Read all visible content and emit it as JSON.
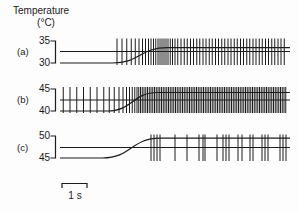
{
  "title": {
    "line1": "Temperature",
    "line2": "(°C)"
  },
  "scale_bar": {
    "label": "1 s",
    "seconds": 1
  },
  "chart_data": {
    "type": "line",
    "title": "Temperature (°C)",
    "layout_hint": "three stacked traces, each with spike train over a temperature ramp; time scale bar 1 s",
    "panels": [
      {
        "label": "(a)",
        "y_ticks": [
          35,
          30
        ],
        "baseline_temp_c": 30,
        "plateau_temp_c": 33.5,
        "ramp_start_s": 2.1,
        "ramp_end_s": 4.3,
        "duration_s": 9.2,
        "spike_times_s": [
          2.28,
          2.48,
          2.67,
          2.85,
          3.01,
          3.16,
          3.3,
          3.42,
          3.54,
          3.64,
          3.74,
          3.83,
          3.92,
          4.0,
          4.08,
          4.16,
          4.24,
          4.32,
          4.41,
          4.5,
          4.6,
          4.71,
          4.84,
          4.97,
          5.09,
          5.22,
          5.34,
          5.47,
          5.59,
          5.72,
          5.84,
          5.97,
          6.09,
          6.22,
          6.34,
          6.47,
          6.59,
          6.72,
          6.84,
          6.97,
          7.09,
          7.22,
          7.34,
          7.47,
          7.59,
          7.72,
          7.84,
          7.97,
          8.09,
          8.22,
          8.34,
          8.47,
          8.59,
          8.72,
          8.84,
          8.97
        ]
      },
      {
        "label": "(b)",
        "y_ticks": [
          45,
          40
        ],
        "baseline_temp_c": 40,
        "plateau_temp_c": 44.2,
        "ramp_start_s": 1.9,
        "ramp_end_s": 3.9,
        "duration_s": 9.2,
        "spike_times_s": [
          0.13,
          0.4,
          0.67,
          0.94,
          1.21,
          1.48,
          1.75,
          1.97,
          2.17,
          2.36,
          2.52,
          2.66,
          2.78,
          2.89,
          2.99,
          3.08,
          3.15,
          3.22,
          3.29,
          3.36,
          3.43,
          3.5,
          3.57,
          3.64,
          3.71,
          3.78,
          3.85,
          3.92,
          3.99,
          4.06,
          4.13,
          4.2,
          4.27,
          4.34,
          4.41,
          4.48,
          4.55,
          4.62,
          4.69,
          4.76,
          4.83,
          4.9,
          4.97,
          5.04,
          5.11,
          5.18,
          5.25,
          5.32,
          5.39,
          5.46,
          5.53,
          5.6,
          5.67,
          5.74,
          5.81,
          5.88,
          5.95,
          6.02,
          6.09,
          6.16,
          6.23,
          6.3,
          6.37,
          6.44,
          6.51,
          6.58,
          6.65,
          6.72,
          6.79,
          6.86,
          6.93,
          7.0,
          7.07,
          7.14,
          7.21,
          7.28,
          7.35,
          7.42,
          7.49,
          7.56,
          7.63,
          7.7,
          7.77,
          7.84,
          7.91,
          7.98,
          8.05,
          8.12,
          8.19,
          8.26,
          8.33,
          8.4,
          8.47,
          8.54,
          8.61,
          8.68,
          8.75,
          8.82,
          8.89,
          8.96,
          9.03
        ]
      },
      {
        "label": "(c)",
        "y_ticks": [
          50,
          45
        ],
        "baseline_temp_c": 45,
        "plateau_temp_c": 49.5,
        "ramp_start_s": 1.7,
        "ramp_end_s": 4.0,
        "duration_s": 9.2,
        "spike_times_s": [
          3.64,
          3.76,
          3.88,
          4.0,
          4.6,
          5.08,
          5.56,
          5.72,
          5.8,
          6.28,
          6.52,
          6.64,
          6.76,
          7.12,
          7.28,
          7.6,
          7.72,
          8.08,
          8.2,
          8.32,
          8.8,
          8.92,
          9.04
        ]
      }
    ]
  }
}
